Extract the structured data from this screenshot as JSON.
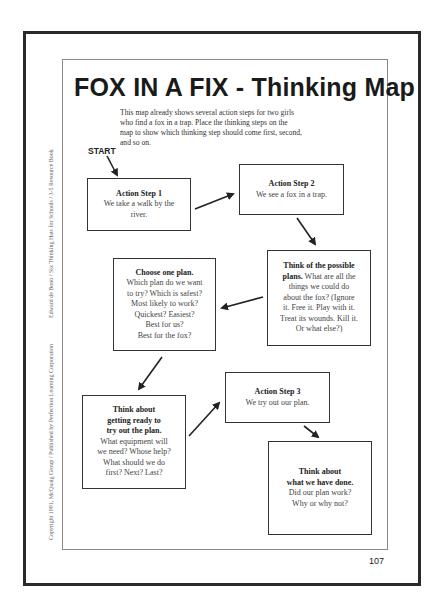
{
  "page": {
    "title": "FOX IN A FIX - Thinking Map",
    "intro_lines": [
      "This map already shows several action steps for two girls",
      "who find a fox in a trap. Place the thinking steps on the",
      "map to show which thinking step should come first, second,",
      "and so on."
    ],
    "start_label": "START",
    "page_number": "107",
    "side_text_top": "Edward de Bono / Six Thinking Hats for Schools / 3-5 Resource Book",
    "side_text_bottom": "Copyright 1991, McQuaig Group / Published by Perfection Learning Corporation"
  },
  "boxes": {
    "action1": {
      "heading": "Action Step 1",
      "lines": [
        "We take a walk by the",
        "river."
      ]
    },
    "action2": {
      "heading": "Action Step 2",
      "lines": [
        "We see a fox in a trap."
      ]
    },
    "think_plans": {
      "heading_lines": [
        "Think of the possible"
      ],
      "lines": [
        "plans. What are all the",
        "things we could do",
        "about the fox? (Ignore",
        "it. Free it. Play with it.",
        "Treat its wounds. Kill it.",
        "Or what else?)"
      ],
      "inline_bold": "plans."
    },
    "choose": {
      "heading_lines": [
        "Choose one plan."
      ],
      "lines": [
        "Which plan do we want",
        "to try? Which is safest?",
        "Most likely to work?",
        "Quickest? Easiest?",
        "Best for us?",
        "Best for the fox?"
      ]
    },
    "think_ready": {
      "heading_lines": [
        "Think about",
        "getting ready to",
        "try out the plan."
      ],
      "lines": [
        "What equipment will",
        "we need? Whose help?",
        "What should we do",
        "first? Next? Last?"
      ]
    },
    "action3": {
      "heading": "Action Step 3",
      "lines": [
        "We try out our plan."
      ]
    },
    "think_done": {
      "heading_lines": [
        "Think about",
        "what we have done."
      ],
      "lines": [
        "Did our plan work?",
        "Why or why not?"
      ]
    }
  },
  "colors": {
    "ink": "#222222",
    "frame": "#2a2a2a",
    "inner_frame": "#8a8a8a"
  }
}
